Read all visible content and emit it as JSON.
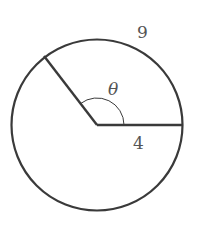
{
  "diagram": {
    "type": "circle-sector",
    "labels": {
      "arc_length": "9",
      "radius": "4",
      "angle": "θ"
    },
    "colors": {
      "stroke": "#3a3a3a",
      "text": "#555555",
      "background": "#ffffff"
    }
  }
}
